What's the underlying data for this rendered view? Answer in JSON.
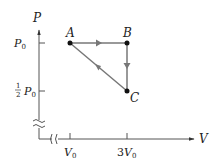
{
  "diagram": {
    "type": "PV diagram",
    "axes": {
      "y_label": "P",
      "x_label": "V",
      "y_ticks": [
        {
          "label": "P0",
          "main": "P",
          "sub": "0"
        },
        {
          "label": "1/2 P0",
          "frac_num": "1",
          "frac_den": "2",
          "main": "P",
          "sub": "0"
        }
      ],
      "x_ticks": [
        {
          "label": "V0",
          "main": "V",
          "sub": "0"
        },
        {
          "label": "3V0",
          "prefix": "3",
          "main": "V",
          "sub": "0"
        }
      ],
      "axis_breaks": [
        "vertical",
        "horizontal"
      ]
    },
    "points": [
      {
        "name": "A",
        "V": "V0",
        "P": "P0"
      },
      {
        "name": "B",
        "V": "3V0",
        "P": "P0"
      },
      {
        "name": "C",
        "V": "3V0",
        "P": "1/2 P0"
      }
    ],
    "process_arrows": [
      {
        "from": "A",
        "to": "B"
      },
      {
        "from": "B",
        "to": "C"
      },
      {
        "from": "C",
        "to": "A"
      }
    ],
    "colors": {
      "axis": "#555555",
      "path": "#777777",
      "point": "#111111",
      "text": "#222222"
    }
  }
}
